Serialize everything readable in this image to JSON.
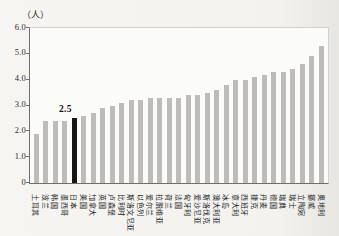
{
  "chart_data": {
    "type": "bar",
    "title": "",
    "unit_label": "（人）",
    "xlabel": "",
    "ylabel": "人",
    "ylim": [
      0,
      6.0
    ],
    "yticks": [
      "0",
      "1.0",
      "2.0",
      "3.0",
      "4.0",
      "5.0",
      "6.0"
    ],
    "grid": false,
    "legend": false,
    "bar_color": "#bdbcba",
    "categories": [
      "土耳其",
      "波兰",
      "韩国",
      "墨西哥",
      "日本",
      "美国",
      "加拿大",
      "英国",
      "卢森堡",
      "比利时",
      "斯洛文尼亚",
      "以色列",
      "爱尔兰",
      "拉脱维亚",
      "荷兰",
      "法国",
      "匈牙利",
      "爱沙尼亚",
      "斯洛伐克",
      "澳大利亚",
      "冰岛",
      "意大利",
      "西班牙",
      "捷克",
      "丹麦",
      "德国",
      "瑞典",
      "瑞士",
      "立陶宛",
      "挪威",
      "奥地利"
    ],
    "values": [
      1.9,
      2.4,
      2.4,
      2.4,
      2.5,
      2.6,
      2.7,
      2.9,
      3.0,
      3.1,
      3.2,
      3.2,
      3.3,
      3.3,
      3.3,
      3.3,
      3.4,
      3.4,
      3.5,
      3.6,
      3.8,
      4.0,
      4.0,
      4.1,
      4.2,
      4.3,
      4.3,
      4.4,
      4.6,
      4.9,
      5.3
    ],
    "highlight": {
      "category": "日本",
      "index": 4,
      "value_label": "2.5",
      "color": "#161616"
    }
  }
}
